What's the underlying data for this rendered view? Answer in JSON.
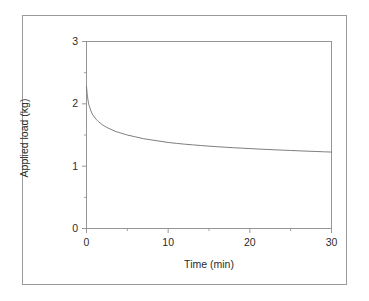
{
  "figure": {
    "background_color": "#ffffff",
    "outer_border_color": "#9a9a9a",
    "axis_color": "#8c8c8c",
    "curve_color": "#6e6e6e",
    "text_color": "#2b2b2b"
  },
  "chart_data": {
    "type": "line",
    "title": "",
    "subtitle": "",
    "xlabel": "Time (min)",
    "ylabel": "Applied load (kg)",
    "xlim": [
      0,
      30
    ],
    "ylim": [
      0,
      3
    ],
    "xticks": [
      0,
      10,
      20,
      30
    ],
    "xtick_labels": [
      "0",
      "10",
      "20",
      "30"
    ],
    "xminor_ticks": [
      5,
      15,
      25
    ],
    "yticks": [
      0,
      1,
      2,
      3
    ],
    "ytick_labels": [
      "0",
      "1",
      "2",
      "3"
    ],
    "yminor_ticks": [
      0.5,
      1.5,
      2.5
    ],
    "grid": false,
    "legend": null,
    "legend_position": "none",
    "annotations": [],
    "series": [
      {
        "name": "Applied load",
        "x": [
          0.0,
          0.08,
          0.16,
          0.25,
          0.35,
          0.5,
          0.7,
          0.9,
          1.2,
          1.5,
          2.0,
          2.5,
          3.0,
          3.5,
          4.0,
          5.0,
          6.0,
          7.0,
          8.0,
          9.0,
          10.0,
          11.0,
          12.0,
          13.0,
          14.0,
          15.0,
          16.0,
          17.0,
          18.0,
          19.0,
          20.0,
          21.0,
          22.0,
          23.0,
          24.0,
          25.0,
          26.0,
          27.0,
          28.0,
          29.0,
          30.0
        ],
        "y": [
          2.28,
          2.16,
          2.08,
          2.01,
          1.96,
          1.9,
          1.84,
          1.8,
          1.75,
          1.71,
          1.66,
          1.62,
          1.59,
          1.56,
          1.54,
          1.5,
          1.47,
          1.44,
          1.42,
          1.4,
          1.38,
          1.366,
          1.353,
          1.342,
          1.331,
          1.321,
          1.312,
          1.304,
          1.296,
          1.289,
          1.282,
          1.275,
          1.269,
          1.263,
          1.257,
          1.252,
          1.246,
          1.241,
          1.236,
          1.231,
          1.226
        ]
      }
    ]
  }
}
